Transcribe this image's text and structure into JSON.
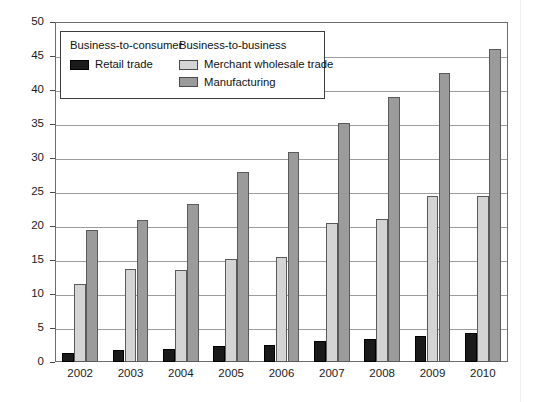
{
  "chart_data": {
    "type": "bar",
    "title": "",
    "xlabel": "",
    "ylabel": "",
    "ylim": [
      0,
      50
    ],
    "ytick_step": 5,
    "grid": true,
    "legend_position": "top-left-inside",
    "categories": [
      "2002",
      "2003",
      "2004",
      "2005",
      "2006",
      "2007",
      "2008",
      "2009",
      "2010"
    ],
    "yticks": [
      "0",
      "5",
      "10",
      "15",
      "20",
      "25",
      "30",
      "35",
      "40",
      "45",
      "50"
    ],
    "series": [
      {
        "name": "Retail trade",
        "group": "Business-to-consumer",
        "color": "#1a1a1a",
        "values": [
          1.3,
          1.7,
          1.9,
          2.3,
          2.5,
          3.1,
          3.4,
          3.8,
          4.3
        ]
      },
      {
        "name": "Merchant wholesale trade",
        "group": "Business-to-business",
        "color": "#d4d4d4",
        "values": [
          11.5,
          13.7,
          13.5,
          15.2,
          15.5,
          20.4,
          21.1,
          24.4,
          24.4
        ]
      },
      {
        "name": "Manufacturing",
        "group": "Business-to-business",
        "color": "#9b9b9b",
        "values": [
          19.4,
          20.9,
          23.2,
          28.0,
          30.9,
          35.1,
          39.0,
          42.5,
          46.0
        ]
      }
    ]
  },
  "legend": {
    "group_b2c_title": "Business-to-consumer",
    "group_b2b_title": "Business-to-business",
    "retail_label": "Retail trade",
    "wholesale_label": "Merchant wholesale trade",
    "manufacturing_label": "Manufacturing"
  }
}
